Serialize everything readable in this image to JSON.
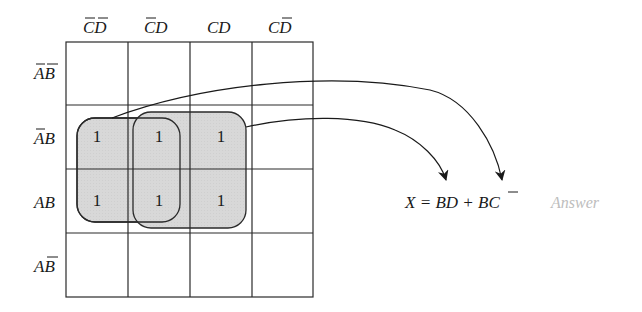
{
  "kmap": {
    "col_headers": [
      {
        "text": "CD",
        "overline": [
          "C",
          "D"
        ]
      },
      {
        "text": "CD",
        "overline": [
          "C"
        ]
      },
      {
        "text": "CD",
        "overline": []
      },
      {
        "text": "CD",
        "overline": [
          "D"
        ]
      }
    ],
    "row_headers": [
      {
        "text": "AB",
        "overline": [
          "A",
          "B"
        ]
      },
      {
        "text": "AB",
        "overline": [
          "A"
        ]
      },
      {
        "text": "AB",
        "overline": []
      },
      {
        "text": "AB",
        "overline": [
          "B"
        ]
      }
    ],
    "cells": [
      [
        "",
        "",
        "",
        ""
      ],
      [
        "1",
        "1",
        "1",
        ""
      ],
      [
        "1",
        "1",
        "1",
        ""
      ],
      [
        "",
        "",
        "",
        ""
      ]
    ],
    "groups": [
      {
        "term": "BC̄",
        "cells": "rows 2-3, cols 1-2"
      },
      {
        "term": "BD",
        "cells": "rows 2-3, cols 2-3"
      }
    ],
    "loop_fill": "#d9d9d9"
  },
  "result": {
    "equation": "X = BD + BC̄",
    "parts": {
      "lhs": "X",
      "eq": "=",
      "t1": "BD",
      "plus": "+",
      "t2a": "B",
      "t2b": "C"
    },
    "annotation": "Answer"
  }
}
